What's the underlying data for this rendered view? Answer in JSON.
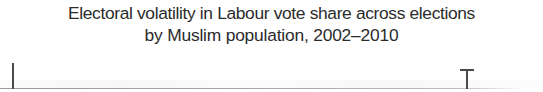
{
  "figure": {
    "title_line_1": "Electoral volatility in Labour vote share across elections",
    "title_line_2": "by Muslim population, 2002–2010",
    "background_color": "#ffffff",
    "title_color": "#2b2b2b",
    "axis_color": "#9a9a9a",
    "marker_color": "#4a4a4a"
  },
  "chart_data": {
    "type": "scatter",
    "title": "Electoral volatility in Labour vote share across elections by Muslim population, 2002–2010",
    "subtitle": "by Muslim population, 2002–2010",
    "xlabel": "",
    "ylabel": "",
    "grid": false,
    "legend": "none",
    "note": "Only the top sliver of the plot is visible in this crop: a light grey horizontal axis line with two vertical marks rising from it.",
    "axis_line": {
      "orientation": "horizontal",
      "y_px": 88,
      "x_start_px": 0,
      "x_end_px": 522,
      "color": "#9a9a9a"
    },
    "markers": [
      {
        "name": "left-tick",
        "shape": "vertical-line",
        "x_px": 13,
        "top_px": 63,
        "bottom_px": 89,
        "color": "#4a4a4a"
      },
      {
        "name": "right-t-marker",
        "shape": "t-bar",
        "x_px": 467,
        "cap_left_px": 460,
        "cap_right_px": 474,
        "top_px": 69,
        "bottom_px": 89,
        "color": "#4a4a4a"
      }
    ]
  }
}
